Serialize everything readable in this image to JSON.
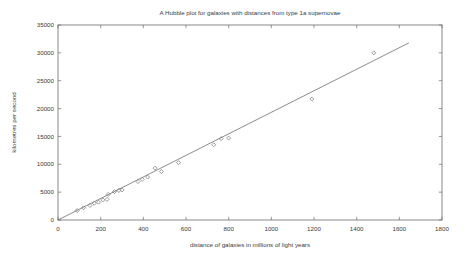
{
  "chart_data": {
    "type": "scatter",
    "title": "A Hubble plot for galaxies with distances from type 1a supernovae",
    "xlabel": "distance of galaxies in millions of light years",
    "ylabel": "kilometres per second",
    "xlim": [
      0,
      1800
    ],
    "ylim": [
      0,
      35000
    ],
    "xticks": [
      0,
      200,
      400,
      600,
      800,
      1000,
      1200,
      1400,
      1600,
      1800
    ],
    "yticks": [
      0,
      5000,
      10000,
      15000,
      20000,
      25000,
      30000,
      35000
    ],
    "grid": false,
    "legend": "none",
    "marker": "open-diamond",
    "points": [
      [
        90,
        1700
      ],
      [
        120,
        2200
      ],
      [
        150,
        2600
      ],
      [
        170,
        3000
      ],
      [
        190,
        3200
      ],
      [
        210,
        3600
      ],
      [
        230,
        3700
      ],
      [
        235,
        4600
      ],
      [
        265,
        5100
      ],
      [
        285,
        5300
      ],
      [
        300,
        5400
      ],
      [
        375,
        6900
      ],
      [
        395,
        7300
      ],
      [
        420,
        7700
      ],
      [
        455,
        9300
      ],
      [
        485,
        8700
      ],
      [
        565,
        10300
      ],
      [
        730,
        13500
      ],
      [
        765,
        14600
      ],
      [
        800,
        14700
      ],
      [
        1190,
        21700
      ],
      [
        1480,
        30000
      ]
    ],
    "fit_line": {
      "x1": 0,
      "y1": 0,
      "x2": 1645,
      "y2": 31800
    },
    "colors": {
      "background": "#ffffff",
      "box": "#6b6b6b",
      "line": "#6e6e6e",
      "marker": "#828282",
      "text": "#3a3a3a"
    }
  }
}
